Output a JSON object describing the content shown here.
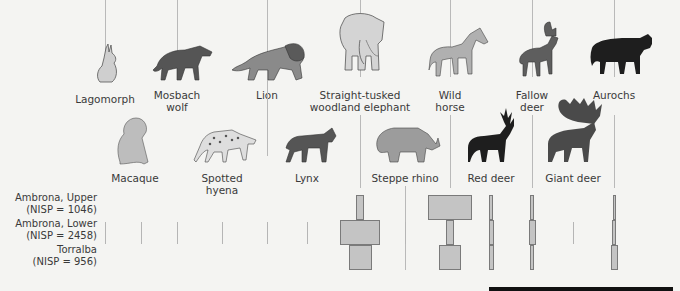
{
  "figure": {
    "top_row_animals": [
      {
        "key": "lagomorph",
        "label": "Lagomorph",
        "x": 105,
        "label_y": 93
      },
      {
        "key": "mosbach_wolf",
        "label": "Mosbach\nwolf",
        "x": 177,
        "label_y": 89
      },
      {
        "key": "lion",
        "label": "Lion",
        "x": 267,
        "label_y": 89
      },
      {
        "key": "elephant",
        "label": "Straight-tusked\nwoodland elephant",
        "x": 360,
        "label_y": 89
      },
      {
        "key": "wild_horse",
        "label": "Wild\nhorse",
        "x": 450,
        "label_y": 89
      },
      {
        "key": "fallow_deer",
        "label": "Fallow\ndeer",
        "x": 532,
        "label_y": 89
      },
      {
        "key": "aurochs",
        "label": "Aurochs",
        "x": 614,
        "label_y": 89
      }
    ],
    "bottom_row_animals": [
      {
        "key": "macaque",
        "label": "Macaque",
        "x": 135,
        "label_y": 172
      },
      {
        "key": "spotted_hyena",
        "label": "Spotted\nhyena",
        "x": 222,
        "label_y": 172
      },
      {
        "key": "lynx",
        "label": "Lynx",
        "x": 307,
        "label_y": 172
      },
      {
        "key": "steppe_rhino",
        "label": "Steppe rhino",
        "x": 405,
        "label_y": 172
      },
      {
        "key": "red_deer",
        "label": "Red deer",
        "x": 491,
        "label_y": 172
      },
      {
        "key": "giant_deer",
        "label": "Giant deer",
        "x": 573,
        "label_y": 172
      }
    ],
    "sites": [
      {
        "label": "Ambrona, Upper\n(NISP = 1046)",
        "y": 192
      },
      {
        "label": "Ambrona, Lower\n(NISP = 2458)",
        "y": 218
      },
      {
        "label": "Torralba\n(NISP = 956)",
        "y": 244
      }
    ]
  },
  "chart_data": {
    "type": "table",
    "title": "",
    "rows": [
      "Ambrona, Upper (NISP = 1046)",
      "Ambrona, Lower (NISP = 2458)",
      "Torralba (NISP = 956)"
    ],
    "columns": [
      "Lagomorph",
      "Macaque",
      "Mosbach wolf",
      "Spotted hyena",
      "Lion",
      "Lynx",
      "Straight-tusked woodland elephant",
      "Steppe rhino",
      "Wild horse",
      "Red deer",
      "Fallow deer",
      "Giant deer",
      "Aurochs"
    ],
    "relative_width": {
      "Lagomorph": [
        0,
        1,
        0
      ],
      "Macaque": [
        0,
        1,
        0
      ],
      "Mosbach wolf": [
        0,
        1,
        0
      ],
      "Spotted hyena": [
        0,
        1,
        0
      ],
      "Lion": [
        0,
        1,
        1
      ],
      "Lynx": [
        0,
        1,
        0
      ],
      "Straight-tusked woodland elephant": [
        8,
        40,
        23
      ],
      "Steppe rhino": [
        0,
        1,
        0
      ],
      "Wild horse": [
        44,
        8,
        22
      ],
      "Red deer": [
        4,
        5,
        5
      ],
      "Fallow deer": [
        4,
        7,
        4
      ],
      "Giant deer": [
        0,
        1,
        0
      ],
      "Aurochs": [
        3,
        4,
        7
      ]
    }
  }
}
